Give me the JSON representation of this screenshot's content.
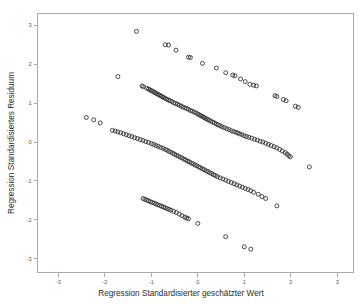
{
  "chart_data": {
    "type": "scatter",
    "title": "",
    "xlabel": "Regression Standardisierter geschätzter Wert",
    "ylabel": "Regression Standardisiertes Residuum",
    "xlim": [
      -3.45,
      3.35
    ],
    "ylim": [
      -3.35,
      3.3
    ],
    "xticks": [
      -3,
      -2,
      -1,
      0,
      1,
      2,
      3
    ],
    "xtick_labels": [
      "-3",
      "-2",
      "-1",
      "0",
      "1",
      "2",
      "3"
    ],
    "yticks": [
      -3,
      -2,
      -1,
      0,
      1,
      2,
      3
    ],
    "ytick_labels": [
      "-3",
      "-2",
      "-1",
      "0",
      "1",
      "2",
      "3"
    ],
    "grid": false,
    "legend": false,
    "marker": {
      "shape": "open-circle",
      "radius": 2.0,
      "stroke": "#2a2a2a",
      "fill": "none"
    },
    "frame_color": "#a9a9a9",
    "background": "#ffffff",
    "series": [
      {
        "name": "band-1-upper",
        "points": [
          [
            -1.32,
            2.84
          ],
          [
            -0.7,
            2.5
          ],
          [
            -0.63,
            2.49
          ],
          [
            -0.47,
            2.36
          ],
          [
            -0.2,
            2.18
          ],
          [
            -0.16,
            2.17
          ],
          [
            0.1,
            2.02
          ],
          [
            0.4,
            1.9
          ],
          [
            0.6,
            1.78
          ],
          [
            0.75,
            1.72
          ],
          [
            0.8,
            1.7
          ],
          [
            0.92,
            1.62
          ],
          [
            1.02,
            1.55
          ],
          [
            1.12,
            1.48
          ],
          [
            1.2,
            1.46
          ],
          [
            1.26,
            1.44
          ],
          [
            1.66,
            1.19
          ],
          [
            1.7,
            1.17
          ],
          [
            1.84,
            1.09
          ],
          [
            1.9,
            1.06
          ],
          [
            2.1,
            0.92
          ],
          [
            2.16,
            0.89
          ],
          [
            -1.72,
            1.68
          ]
        ]
      },
      {
        "name": "band-2",
        "points": [
          [
            -1.2,
            1.44
          ],
          [
            -1.17,
            1.42
          ],
          [
            -1.1,
            1.38
          ],
          [
            -1.06,
            1.36
          ],
          [
            -1.03,
            1.34
          ],
          [
            -1.0,
            1.32
          ],
          [
            -0.97,
            1.3
          ],
          [
            -0.94,
            1.28
          ],
          [
            -0.91,
            1.26
          ],
          [
            -0.88,
            1.24
          ],
          [
            -0.85,
            1.22
          ],
          [
            -0.82,
            1.2
          ],
          [
            -0.79,
            1.18
          ],
          [
            -0.76,
            1.16
          ],
          [
            -0.73,
            1.14
          ],
          [
            -0.7,
            1.12
          ],
          [
            -0.67,
            1.1
          ],
          [
            -0.63,
            1.08
          ],
          [
            -0.6,
            1.06
          ],
          [
            -0.56,
            1.04
          ],
          [
            -0.52,
            1.01
          ],
          [
            -0.48,
            0.99
          ],
          [
            -0.44,
            0.97
          ],
          [
            -0.4,
            0.95
          ],
          [
            -0.36,
            0.92
          ],
          [
            -0.32,
            0.9
          ],
          [
            -0.28,
            0.88
          ],
          [
            -0.24,
            0.86
          ],
          [
            -0.2,
            0.84
          ],
          [
            -0.16,
            0.81
          ],
          [
            -0.12,
            0.79
          ],
          [
            -0.08,
            0.77
          ],
          [
            -0.04,
            0.75
          ],
          [
            0.0,
            0.72
          ],
          [
            0.03,
            0.7
          ],
          [
            0.06,
            0.68
          ],
          [
            0.09,
            0.66
          ],
          [
            0.12,
            0.64
          ],
          [
            0.15,
            0.62
          ],
          [
            0.18,
            0.6
          ],
          [
            0.21,
            0.58
          ],
          [
            0.24,
            0.56
          ],
          [
            0.28,
            0.54
          ],
          [
            0.32,
            0.51
          ],
          [
            0.36,
            0.49
          ],
          [
            0.4,
            0.46
          ],
          [
            0.44,
            0.44
          ],
          [
            0.48,
            0.42
          ],
          [
            0.52,
            0.39
          ],
          [
            0.57,
            0.37
          ],
          [
            0.62,
            0.34
          ],
          [
            0.67,
            0.32
          ],
          [
            0.72,
            0.29
          ],
          [
            0.77,
            0.27
          ],
          [
            0.82,
            0.25
          ],
          [
            0.86,
            0.23
          ],
          [
            0.9,
            0.21
          ],
          [
            0.95,
            0.19
          ],
          [
            1.0,
            0.16
          ],
          [
            1.05,
            0.14
          ],
          [
            1.1,
            0.12
          ],
          [
            1.16,
            0.1
          ],
          [
            1.22,
            0.07
          ],
          [
            1.28,
            0.05
          ],
          [
            1.34,
            0.02
          ],
          [
            1.4,
            0.0
          ],
          [
            1.46,
            -0.03
          ],
          [
            1.52,
            -0.06
          ],
          [
            1.58,
            -0.09
          ],
          [
            1.64,
            -0.12
          ],
          [
            1.7,
            -0.15
          ],
          [
            1.76,
            -0.19
          ],
          [
            1.82,
            -0.23
          ],
          [
            1.88,
            -0.27
          ],
          [
            1.92,
            -0.31
          ],
          [
            1.96,
            -0.35
          ],
          [
            1.99,
            -0.38
          ],
          [
            2.4,
            -0.64
          ]
        ]
      },
      {
        "name": "band-3",
        "points": [
          [
            -1.84,
            0.3
          ],
          [
            -1.78,
            0.28
          ],
          [
            -1.72,
            0.26
          ],
          [
            -1.66,
            0.24
          ],
          [
            -1.6,
            0.21
          ],
          [
            -1.54,
            0.19
          ],
          [
            -1.48,
            0.16
          ],
          [
            -1.42,
            0.14
          ],
          [
            -1.36,
            0.11
          ],
          [
            -1.3,
            0.09
          ],
          [
            -1.24,
            0.06
          ],
          [
            -1.18,
            0.04
          ],
          [
            -1.12,
            0.01
          ],
          [
            -1.06,
            -0.01
          ],
          [
            -1.0,
            -0.04
          ],
          [
            -0.95,
            -0.06
          ],
          [
            -0.9,
            -0.09
          ],
          [
            -0.85,
            -0.11
          ],
          [
            -0.8,
            -0.14
          ],
          [
            -0.75,
            -0.16
          ],
          [
            -0.7,
            -0.19
          ],
          [
            -0.66,
            -0.21
          ],
          [
            -0.62,
            -0.24
          ],
          [
            -0.58,
            -0.26
          ],
          [
            -0.54,
            -0.29
          ],
          [
            -0.5,
            -0.31
          ],
          [
            -0.46,
            -0.34
          ],
          [
            -0.42,
            -0.36
          ],
          [
            -0.38,
            -0.39
          ],
          [
            -0.34,
            -0.41
          ],
          [
            -0.3,
            -0.44
          ],
          [
            -0.26,
            -0.46
          ],
          [
            -0.22,
            -0.49
          ],
          [
            -0.18,
            -0.51
          ],
          [
            -0.14,
            -0.54
          ],
          [
            -0.1,
            -0.56
          ],
          [
            -0.06,
            -0.59
          ],
          [
            -0.02,
            -0.61
          ],
          [
            0.02,
            -0.64
          ],
          [
            0.06,
            -0.66
          ],
          [
            0.1,
            -0.69
          ],
          [
            0.14,
            -0.71
          ],
          [
            0.18,
            -0.74
          ],
          [
            0.22,
            -0.76
          ],
          [
            0.26,
            -0.79
          ],
          [
            0.3,
            -0.81
          ],
          [
            0.34,
            -0.84
          ],
          [
            0.38,
            -0.86
          ],
          [
            0.42,
            -0.89
          ],
          [
            0.48,
            -0.92
          ],
          [
            0.54,
            -0.95
          ],
          [
            0.6,
            -0.98
          ],
          [
            0.66,
            -1.01
          ],
          [
            0.72,
            -1.04
          ],
          [
            0.78,
            -1.07
          ],
          [
            0.84,
            -1.1
          ],
          [
            0.9,
            -1.13
          ],
          [
            0.96,
            -1.16
          ],
          [
            1.02,
            -1.19
          ],
          [
            1.08,
            -1.22
          ],
          [
            1.14,
            -1.25
          ],
          [
            1.2,
            -1.29
          ],
          [
            1.3,
            -1.34
          ],
          [
            1.38,
            -1.4
          ],
          [
            1.46,
            -1.45
          ],
          [
            1.7,
            -1.64
          ],
          [
            -2.4,
            0.63
          ],
          [
            -2.24,
            0.57
          ],
          [
            -2.1,
            0.49
          ]
        ]
      },
      {
        "name": "band-4-lower",
        "points": [
          [
            -1.18,
            -1.45
          ],
          [
            -1.14,
            -1.47
          ],
          [
            -1.1,
            -1.49
          ],
          [
            -1.06,
            -1.51
          ],
          [
            -1.02,
            -1.53
          ],
          [
            -0.98,
            -1.55
          ],
          [
            -0.94,
            -1.57
          ],
          [
            -0.9,
            -1.59
          ],
          [
            -0.86,
            -1.61
          ],
          [
            -0.82,
            -1.63
          ],
          [
            -0.78,
            -1.65
          ],
          [
            -0.74,
            -1.67
          ],
          [
            -0.7,
            -1.69
          ],
          [
            -0.66,
            -1.71
          ],
          [
            -0.62,
            -1.73
          ],
          [
            -0.58,
            -1.75
          ],
          [
            -0.52,
            -1.78
          ],
          [
            -0.46,
            -1.81
          ],
          [
            -0.4,
            -1.85
          ],
          [
            -0.34,
            -1.89
          ],
          [
            -0.28,
            -1.93
          ],
          [
            -0.24,
            -1.95
          ],
          [
            -0.2,
            -1.97
          ],
          [
            0.0,
            -2.09
          ],
          [
            0.6,
            -2.43
          ],
          [
            1.0,
            -2.69
          ],
          [
            1.14,
            -2.75
          ]
        ]
      }
    ]
  }
}
